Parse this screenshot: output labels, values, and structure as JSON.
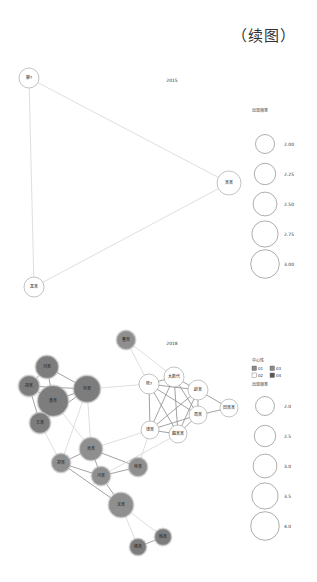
{
  "caption": "（续图）",
  "chart_data": [
    {
      "type": "network",
      "title": "2015",
      "nodes": [
        {
          "id": "n1",
          "label": "廖?",
          "x": 29,
          "y": 78,
          "r": 10,
          "group": null
        },
        {
          "id": "n2",
          "label": "某某",
          "x": 229,
          "y": 183,
          "r": 12,
          "group": null
        },
        {
          "id": "n3",
          "label": "黑某",
          "x": 34,
          "y": 287,
          "r": 10,
          "group": null
        }
      ],
      "edges": [
        [
          "n1",
          "n2"
        ],
        [
          "n1",
          "n3"
        ],
        [
          "n2",
          "n3"
        ]
      ],
      "legend": {
        "size_title": "出现频率",
        "size_values": [
          "2.00",
          "2.25",
          "2.50",
          "2.75",
          "3.00"
        ]
      }
    },
    {
      "type": "network",
      "title": "2018",
      "nodes": [
        {
          "id": "m1",
          "label": "董某",
          "x": 126,
          "y": 340,
          "r": 9,
          "group": "01"
        },
        {
          "id": "m2",
          "label": "刘某",
          "x": 47,
          "y": 367,
          "r": 11,
          "group": "04"
        },
        {
          "id": "m3",
          "label": "胡某",
          "x": 29,
          "y": 386,
          "r": 10,
          "group": "04"
        },
        {
          "id": "m4",
          "label": "黄某",
          "x": 53,
          "y": 401,
          "r": 15,
          "group": "04"
        },
        {
          "id": "m5",
          "label": "孙某",
          "x": 87,
          "y": 389,
          "r": 13,
          "group": "04"
        },
        {
          "id": "m6",
          "label": "王某",
          "x": 40,
          "y": 423,
          "r": 10,
          "group": "04"
        },
        {
          "id": "m7",
          "label": "陈?",
          "x": 149,
          "y": 384,
          "r": 10,
          "group": "02"
        },
        {
          "id": "m8",
          "label": "大数代",
          "x": 174,
          "y": 377,
          "r": 10,
          "group": "02"
        },
        {
          "id": "m9",
          "label": "赵某",
          "x": 198,
          "y": 390,
          "r": 10,
          "group": "02"
        },
        {
          "id": "m10",
          "label": "田某某",
          "x": 229,
          "y": 408,
          "r": 9,
          "group": "02"
        },
        {
          "id": "m11",
          "label": "周某",
          "x": 198,
          "y": 415,
          "r": 9,
          "group": "02"
        },
        {
          "id": "m12",
          "label": "钱某",
          "x": 150,
          "y": 430,
          "r": 9,
          "group": "02"
        },
        {
          "id": "m13",
          "label": "魏某某",
          "x": 178,
          "y": 434,
          "r": 9,
          "group": "02"
        },
        {
          "id": "m14",
          "label": "吴某",
          "x": 91,
          "y": 449,
          "r": 11,
          "group": "03"
        },
        {
          "id": "m15",
          "label": "郑某",
          "x": 61,
          "y": 463,
          "r": 9,
          "group": "03"
        },
        {
          "id": "m16",
          "label": "冯某",
          "x": 101,
          "y": 476,
          "r": 9,
          "group": "03"
        },
        {
          "id": "m17",
          "label": "蒋某",
          "x": 138,
          "y": 467,
          "r": 9,
          "group": "03"
        },
        {
          "id": "m18",
          "label": "沈某",
          "x": 121,
          "y": 505,
          "r": 12,
          "group": "03"
        },
        {
          "id": "m19",
          "label": "韩某",
          "x": 163,
          "y": 537,
          "r": 8,
          "group": "04"
        },
        {
          "id": "m20",
          "label": "杨某",
          "x": 138,
          "y": 547,
          "r": 8,
          "group": "04"
        }
      ],
      "edges": [
        [
          "m2",
          "m3"
        ],
        [
          "m2",
          "m4"
        ],
        [
          "m2",
          "m5"
        ],
        [
          "m3",
          "m4"
        ],
        [
          "m3",
          "m5"
        ],
        [
          "m4",
          "m5"
        ],
        [
          "m4",
          "m6"
        ],
        [
          "m5",
          "m6"
        ],
        [
          "m3",
          "m6"
        ],
        [
          "m5",
          "m7"
        ],
        [
          "m1",
          "m7"
        ],
        [
          "m1",
          "m8"
        ],
        [
          "m7",
          "m8"
        ],
        [
          "m7",
          "m9"
        ],
        [
          "m7",
          "m11"
        ],
        [
          "m7",
          "m12"
        ],
        [
          "m7",
          "m13"
        ],
        [
          "m8",
          "m9"
        ],
        [
          "m8",
          "m11"
        ],
        [
          "m8",
          "m12"
        ],
        [
          "m8",
          "m13"
        ],
        [
          "m9",
          "m10"
        ],
        [
          "m9",
          "m11"
        ],
        [
          "m9",
          "m12"
        ],
        [
          "m9",
          "m13"
        ],
        [
          "m11",
          "m12"
        ],
        [
          "m11",
          "m13"
        ],
        [
          "m12",
          "m13"
        ],
        [
          "m10",
          "m11"
        ],
        [
          "m5",
          "m14"
        ],
        [
          "m5",
          "m15"
        ],
        [
          "m6",
          "m15"
        ],
        [
          "m4",
          "m14"
        ],
        [
          "m14",
          "m15"
        ],
        [
          "m14",
          "m16"
        ],
        [
          "m14",
          "m17"
        ],
        [
          "m15",
          "m16"
        ],
        [
          "m16",
          "m17"
        ],
        [
          "m16",
          "m18"
        ],
        [
          "m15",
          "m18"
        ],
        [
          "m14",
          "m12"
        ],
        [
          "m17",
          "m12"
        ],
        [
          "m16",
          "m13"
        ],
        [
          "m18",
          "m19"
        ],
        [
          "m18",
          "m20"
        ],
        [
          "m19",
          "m20"
        ]
      ],
      "legend": {
        "group_title": "中心性",
        "groups": [
          {
            "label": "01",
            "color": "#8a8a8a"
          },
          {
            "label": "03",
            "color": "#8a8a8a"
          },
          {
            "label": "02",
            "color": "#ffffff"
          },
          {
            "label": "04",
            "color": "#5a5a5a"
          }
        ],
        "size_title": "出现频率",
        "size_values": [
          "2.0",
          "2.5",
          "3.0",
          "3.5",
          "4.0"
        ]
      }
    }
  ],
  "colors": {
    "edge": "#c8c8c8",
    "edge_dark": "#8c8c8c",
    "node_fill_dark": "#8f8f8f",
    "node_fill_light": "#ffffff",
    "node_stroke": "#9a9a9a"
  }
}
